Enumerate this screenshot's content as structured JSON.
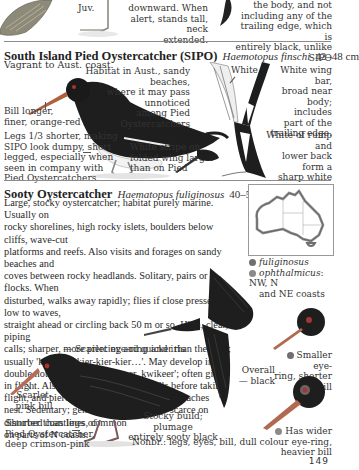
{
  "top_fragment": {
    "juv_label": "Juv.",
    "mid_caption": [
      "downward. When",
      "alert, stands tall, neck",
      "extended."
    ],
    "right_caption": [
      "the body, and not",
      "including any of the",
      "trailing edge, which is",
      "entirely black, unlike SIPO"
    ]
  },
  "sipo": {
    "title": "South Island Pied Oystercatcher (SIPO)",
    "latin": "Haemotopus finschi",
    "size": "42–48 cm",
    "status": "Vagrant to Aust. coast.",
    "callouts": {
      "habitat": [
        "Habitat in Aust., sandy beaches,",
        "where it may pass unnoticed",
        "among Pied Oystercatchers"
      ],
      "white": "White",
      "wing_bar": [
        "White wing bar,",
        "broad near",
        "body; includes",
        "part of the",
        "trailing edge."
      ],
      "rump": [
        "White of rump and",
        "lower back form a",
        "sharp white triangle",
        "— between wings."
      ],
      "bill": [
        "Bill longer,",
        "finer, orange-red"
      ],
      "legs": [
        "Legs 1/3 shorter, making",
        "SIPO look dumpy, short",
        "legged, especially when",
        "seen in company with",
        "Pied Oystercatchers"
      ],
      "stripe": [
        "White stripe on",
        "folded wing larger",
        "than on Pied"
      ]
    }
  },
  "sooty": {
    "title": "Sooty Oystercatcher",
    "latin": "Haematopus fuliginosus",
    "size": "40–52 cm",
    "description": [
      "Large, stocky oystercatcher; habitat purely marine. Usually on",
      "rocky shorelines, high rocky islets, boulders below cliffs, wave-cut",
      "platforms and reefs. Also visits and forages on sandy beaches and",
      "coves between rocky headlands. Solitary, pairs or flocks. When",
      "disturbed, walks away rapidly; flies if close pressed – low to waves,",
      "straight ahead or circling back 50 m or so. High, clear, piping",
      "calls; sharper, more piercing and quicker than the Pied;",
      "usually 'kier-kier-kier-kier-kier…'. May develop into a",
      "double noted 'kwi-keer, kwikeer, kwikeer'; often given",
      "in flight. Also gives loud whistling calls before taking",
      "flight, and piercing calls if an intruder approaches",
      "nest. Sedentary; generally uncommon – scarce on",
      "disturbed coastlines, common",
      "on parts of N coasts."
    ],
    "map_legend": [
      {
        "name": "fuliginosus",
        "note": "",
        "color": "#6f6f6f"
      },
      {
        "name": "ophthalmicus",
        "note": ": NW, N",
        "note2": "and NE coasts",
        "color": "#8a8a8a"
      }
    ],
    "callouts": {
      "eye": "Scarlet eye-ring and iris",
      "bill": [
        "Scarlet-",
        "pink bill"
      ],
      "legs": [
        "Shorter than legs of",
        "Pied Oystercatcher,",
        "deep crimson-pink"
      ],
      "build": [
        "Stocky build; plumage",
        "entirely sooty black"
      ],
      "nonbr": "Nonbr.: legs, eyes, bill, dull colour",
      "overall": [
        "Overall",
        "— black"
      ],
      "smaller": [
        "Smaller eye-",
        "ring, shorter bill"
      ],
      "wider": [
        "Has wider",
        "eye-ring, heavier bill"
      ]
    }
  },
  "page_number": "149",
  "colors": {
    "rule": "#8c8c8c",
    "ink": "#2a2a2a",
    "bird_black": "#1e1e1e",
    "map_outline": "#555555"
  }
}
